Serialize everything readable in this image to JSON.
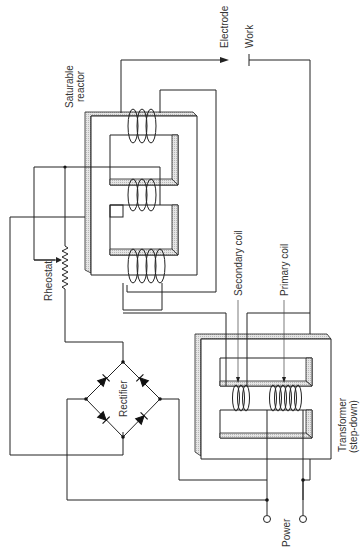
{
  "diagram": {
    "type": "circuit schematic",
    "labels": {
      "electrode": "Electrode",
      "work": "Work",
      "saturable_reactor_line1": "Saturable",
      "saturable_reactor_line2": "reactor",
      "rheostat": "Rheostat",
      "rectifier": "Rectifier",
      "secondary_coil": "Secondary coil",
      "primary_coil": "Primary coil",
      "transformer_line1": "Transformer",
      "transformer_line2": "(step-down)",
      "power": "Power"
    },
    "components": [
      {
        "id": "saturable-reactor",
        "label": "Saturable reactor",
        "coils": 3
      },
      {
        "id": "rheostat",
        "label": "Rheostat"
      },
      {
        "id": "rectifier",
        "label": "Rectifier",
        "diodes": 4,
        "topology": "bridge"
      },
      {
        "id": "transformer",
        "label": "Transformer (step-down)",
        "coils": [
          "Secondary coil",
          "Primary coil"
        ]
      },
      {
        "id": "electrode",
        "label": "Electrode"
      },
      {
        "id": "work",
        "label": "Work"
      },
      {
        "id": "power",
        "label": "Power",
        "terminals": 2
      }
    ]
  }
}
